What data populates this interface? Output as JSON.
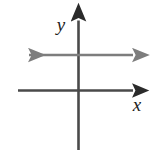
{
  "figure": {
    "kind": "coordinate-plane-graph",
    "width": 159,
    "height": 150,
    "background_color": "#ffffff"
  },
  "axes": {
    "x_axis": {
      "label": "x",
      "color": "#3a3a3a",
      "has_arrowhead_positive": true,
      "has_arrowhead_negative": false
    },
    "y_axis": {
      "label": "y",
      "color": "#3a3a3a",
      "has_arrowhead_positive": true,
      "has_arrowhead_negative": false
    },
    "origin_x": 78,
    "origin_y": 90
  },
  "chart_data": {
    "type": "line",
    "title": "",
    "subtitle": "",
    "xlabel": "x",
    "ylabel": "y",
    "xlim": [
      -6,
      6
    ],
    "ylim": [
      -4,
      4
    ],
    "grid": false,
    "legend": "none",
    "annotations": [],
    "series": [
      {
        "name": "horizontal line",
        "equation": "y = 2",
        "color": "#7d7d7d",
        "arrow_start": true,
        "arrow_end": true,
        "x": [
          -6,
          6
        ],
        "values": [
          2,
          2
        ]
      }
    ],
    "tick_labels": {
      "x": [],
      "y": []
    }
  }
}
